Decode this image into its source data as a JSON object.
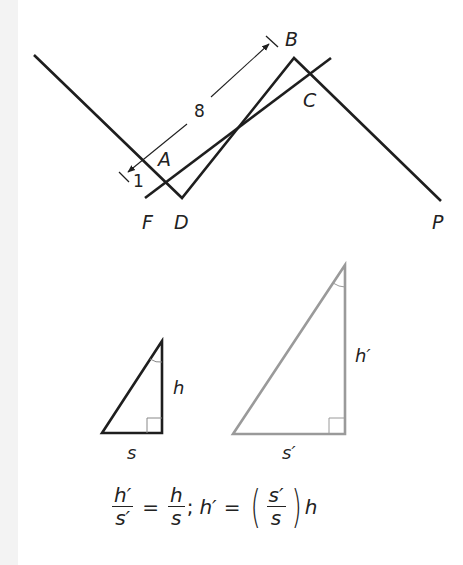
{
  "top_figure": {
    "points": {
      "A": "A",
      "B": "B",
      "C": "C",
      "D": "D",
      "F": "F",
      "P": "P"
    },
    "dimensions": {
      "long": "8",
      "short": "1"
    }
  },
  "triangles": {
    "small": {
      "height_label": "h",
      "base_label": "s"
    },
    "large": {
      "height_label": "h′",
      "base_label": "s′"
    }
  },
  "equation": {
    "f1_num": "h′",
    "f1_den": "s′",
    "eq1": "=",
    "f2_num": "h",
    "f2_den": "s",
    "sep": ";",
    "lhs2": "h′",
    "eq2": "=",
    "lparen": "(",
    "f3_num": "s′",
    "f3_den": "s",
    "rparen": ")",
    "tail": "h"
  },
  "colors": {
    "line": "#1e1e1e",
    "large_triangle": "#9a9a9a"
  }
}
